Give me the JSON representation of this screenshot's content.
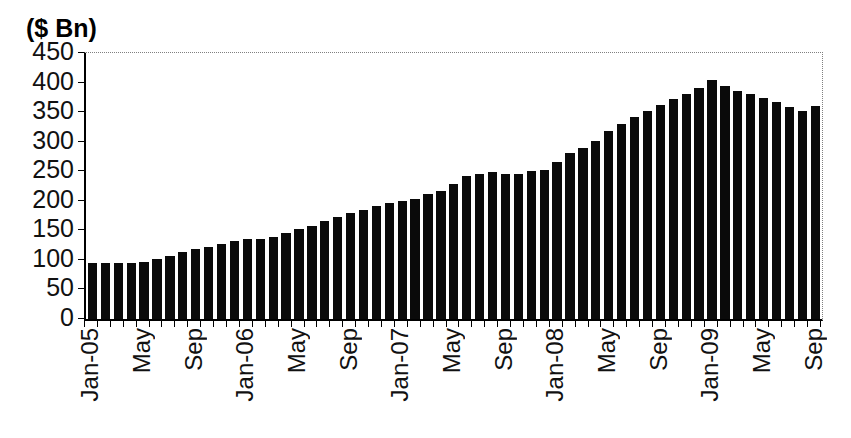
{
  "figure": {
    "title": "($ Bn)"
  },
  "chart_data": {
    "type": "bar",
    "title": "($ Bn)",
    "ylabel": "$ Bn",
    "xlabel": "",
    "ylim": [
      0,
      450
    ],
    "y_ticks": [
      0,
      50,
      100,
      150,
      200,
      250,
      300,
      350,
      400,
      450
    ],
    "bar_color": "#0a0a0a",
    "grid": "top-border-dotted-only",
    "legend": "none",
    "x": [
      "Jan-05",
      "Feb-05",
      "Mar-05",
      "Apr-05",
      "May-05",
      "Jun-05",
      "Jul-05",
      "Aug-05",
      "Sep-05",
      "Oct-05",
      "Nov-05",
      "Dec-05",
      "Jan-06",
      "Feb-06",
      "Mar-06",
      "Apr-06",
      "May-06",
      "Jun-06",
      "Jul-06",
      "Aug-06",
      "Sep-06",
      "Oct-06",
      "Nov-06",
      "Dec-06",
      "Jan-07",
      "Feb-07",
      "Mar-07",
      "Apr-07",
      "May-07",
      "Jun-07",
      "Jul-07",
      "Aug-07",
      "Sep-07",
      "Oct-07",
      "Nov-07",
      "Dec-07",
      "Jan-08",
      "Feb-08",
      "Mar-08",
      "Apr-08",
      "May-08",
      "Jun-08",
      "Jul-08",
      "Aug-08",
      "Sep-08",
      "Oct-08",
      "Nov-08",
      "Dec-08",
      "Jan-09",
      "Feb-09",
      "Mar-09",
      "Apr-09",
      "May-09",
      "Jun-09",
      "Jul-09",
      "Aug-09",
      "Sep-09"
    ],
    "values": [
      95,
      95,
      95,
      95,
      96,
      101,
      106,
      113,
      118,
      122,
      127,
      132,
      135,
      136,
      139,
      145,
      152,
      158,
      165,
      172,
      179,
      185,
      191,
      196,
      199,
      203,
      212,
      216,
      228,
      242,
      246,
      249,
      246,
      245,
      250,
      252,
      266,
      281,
      290,
      302,
      318,
      330,
      342,
      352,
      362,
      372,
      381,
      391,
      405,
      395,
      385,
      380,
      374,
      367,
      359,
      352,
      361
    ],
    "x_tick_labels": [
      {
        "index": 0,
        "label": "Jan-05"
      },
      {
        "index": 4,
        "label": "May"
      },
      {
        "index": 8,
        "label": "Sep"
      },
      {
        "index": 12,
        "label": "Jan-06"
      },
      {
        "index": 16,
        "label": "May"
      },
      {
        "index": 20,
        "label": "Sep"
      },
      {
        "index": 24,
        "label": "Jan-07"
      },
      {
        "index": 28,
        "label": "May"
      },
      {
        "index": 32,
        "label": "Sep"
      },
      {
        "index": 36,
        "label": "Jan-08"
      },
      {
        "index": 40,
        "label": "May"
      },
      {
        "index": 44,
        "label": "Sep"
      },
      {
        "index": 48,
        "label": "Jan-09"
      },
      {
        "index": 52,
        "label": "May"
      },
      {
        "index": 56,
        "label": "Sep"
      }
    ]
  }
}
